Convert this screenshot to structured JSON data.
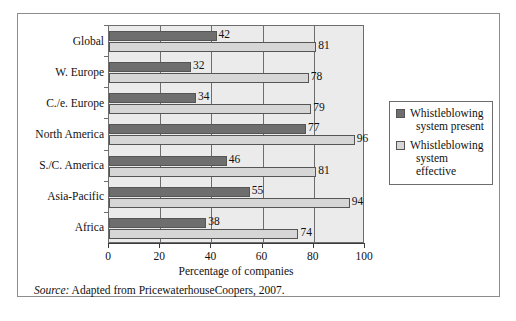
{
  "chart_data": {
    "type": "bar",
    "orientation": "horizontal",
    "title": "",
    "xlabel": "Percentage of companies",
    "ylabel": "",
    "xlim": [
      0,
      100
    ],
    "xticks": [
      "0",
      "20",
      "40",
      "60",
      "80",
      "100"
    ],
    "xtick_values": [
      0,
      20,
      40,
      60,
      80,
      100
    ],
    "grid": true,
    "grid_axis": "x",
    "legend_position": "right",
    "categories": [
      "Global",
      "W. Europe",
      "C./e. Europe",
      "North America",
      "S./C. America",
      "Asia-Pacific",
      "Africa"
    ],
    "series": [
      {
        "name": "Whistleblowing system present",
        "color": "#6e6e6e",
        "values": [
          42,
          32,
          34,
          77,
          46,
          55,
          38
        ]
      },
      {
        "name": "Whistleblowing system effective",
        "color": "#d6d6d6",
        "values": [
          81,
          78,
          79,
          96,
          81,
          94,
          74
        ]
      }
    ],
    "data_labels": {
      "present": [
        "42",
        "32",
        "34",
        "77",
        "46",
        "55",
        "38"
      ],
      "effective": [
        "81",
        "78",
        "79",
        "96",
        "81",
        "94",
        "74"
      ]
    }
  },
  "legend": {
    "items": [
      {
        "label_line1": "Whistleblowing",
        "label_line2": "system present"
      },
      {
        "label_line1": "Whistleblowing",
        "label_line2": "system effective"
      }
    ]
  },
  "axis": {
    "x_title": "Percentage of companies"
  },
  "source": {
    "label": "Source:",
    "text": " Adapted from PricewaterhouseCoopers, 2007."
  }
}
